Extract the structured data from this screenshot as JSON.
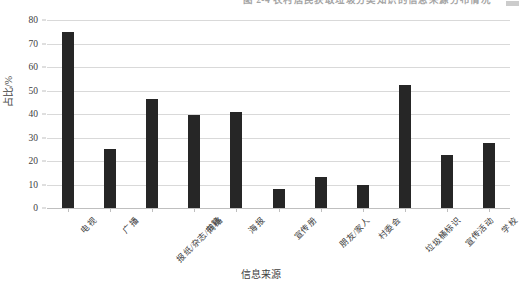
{
  "caption": {
    "text": "图 2-4   农村居民获取垃圾分类知识的信息来源分布情况",
    "note": "partially cropped at top of image"
  },
  "chart_data": {
    "type": "bar",
    "title": "",
    "xlabel": "信息来源",
    "ylabel": "占比/%",
    "ylim": [
      0,
      80
    ],
    "yticks": [
      0,
      10,
      20,
      30,
      40,
      50,
      60,
      70,
      80
    ],
    "ytick_labels": [
      "0",
      "10",
      "20",
      "30",
      "40",
      "50",
      "60",
      "70",
      "80"
    ],
    "grid": "horizontal",
    "legend": "none",
    "bar_color": "#262626",
    "gridline_color": "#d9d9d9",
    "categories": [
      "电视",
      "广播",
      "报纸/杂志/书籍",
      "网络",
      "海报",
      "宣传册",
      "朋友/家人",
      "村委会",
      "垃圾桶标识",
      "宣传活动",
      "学校"
    ],
    "values": [
      75.0,
      25.0,
      46.5,
      39.5,
      41.0,
      8.0,
      13.0,
      10.0,
      52.5,
      22.5,
      27.5
    ]
  }
}
